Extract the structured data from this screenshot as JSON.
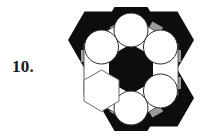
{
  "figure": {
    "label": "10.",
    "caption_text": "10.",
    "kind": "geometric-tiling-diagram",
    "colors": {
      "black": "#0d0d0d",
      "gray": "#9a9a9a",
      "white": "#ffffff",
      "outline": "#5a5a5a",
      "background": "#ffffff",
      "label_color": "#161616"
    },
    "geometry": {
      "canvas_width": 142,
      "canvas_height": 139,
      "center_x": 71,
      "center_y": 69,
      "cell_radius": 33,
      "ring_distance": 34.5,
      "circle_radius": 16.5,
      "core_hex_radius": 25,
      "cells": [
        {
          "name": "cell-top",
          "angle_deg": -90,
          "filled_star": true,
          "has_circle": true
        },
        {
          "name": "cell-upper-right",
          "angle_deg": -30,
          "filled_star": true,
          "has_circle": true
        },
        {
          "name": "cell-lower-right",
          "angle_deg": 30,
          "filled_star": true,
          "has_circle": true
        },
        {
          "name": "cell-bottom",
          "angle_deg": 90,
          "filled_star": true,
          "has_circle": true
        },
        {
          "name": "cell-lower-left",
          "angle_deg": 150,
          "filled_star": false,
          "has_circle": false
        },
        {
          "name": "cell-upper-left",
          "angle_deg": -150,
          "filled_star": true,
          "has_circle": true
        }
      ],
      "gray_connectors": [
        {
          "name": "connector-top-to-upper-left",
          "from": "cell-upper-left",
          "to": "cell-top"
        },
        {
          "name": "connector-top-to-upper-right",
          "from": "cell-top",
          "to": "cell-upper-right"
        },
        {
          "name": "connector-right-pair",
          "from": "cell-upper-right",
          "to": "cell-lower-right"
        },
        {
          "name": "connector-bottom-right",
          "from": "cell-lower-right",
          "to": "cell-bottom"
        },
        {
          "name": "connector-bottom-left",
          "from": "cell-bottom",
          "to": "cell-lower-left"
        },
        {
          "name": "connector-left-upper",
          "from": "cell-lower-left",
          "to": "cell-upper-left"
        }
      ]
    }
  }
}
